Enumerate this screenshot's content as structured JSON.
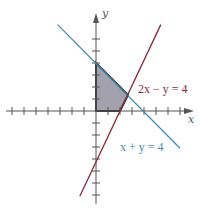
{
  "figure": {
    "origin_px": [
      96,
      111
    ],
    "unit_px": 12,
    "x_ticks": [
      -7,
      -6,
      -5,
      -4,
      -3,
      -2,
      -1,
      1,
      2,
      3,
      4,
      5,
      6,
      7
    ],
    "y_ticks": [
      -7,
      -6,
      -5,
      -4,
      -3,
      -2,
      -1,
      1,
      2,
      3,
      4,
      5,
      6
    ],
    "x_axis_label": "x",
    "y_axis_label": "y",
    "colors": {
      "axis": "#555555",
      "line_1": "#3a8fb5",
      "line_2": "#8b2b3a",
      "region_fill": "#a3a1ad",
      "region_stroke": "#333333",
      "label_1": "#3a8fb5",
      "label_2": "#8b2b3a"
    },
    "lines": [
      {
        "name": "x-plus-y-eq-4",
        "equation": "x + y = 4",
        "from": [
          -3.2,
          7.2
        ],
        "to": [
          7.0,
          -3.1
        ]
      },
      {
        "name": "2x-minus-y-eq-4",
        "equation": "2x − y = 4",
        "from": [
          -1.35,
          -7.1
        ],
        "to": [
          5.4,
          7.2
        ]
      }
    ],
    "feasible_region": {
      "vertices": [
        [
          0,
          0
        ],
        [
          0,
          4
        ],
        [
          2.667,
          1.333
        ],
        [
          2,
          0
        ]
      ]
    },
    "labels": {
      "line_1": "x + y = 4",
      "line_2": "2x − y = 4"
    }
  }
}
